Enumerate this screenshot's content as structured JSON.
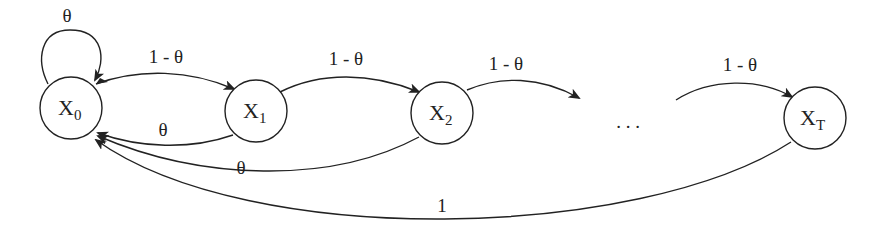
{
  "diagram": {
    "type": "markov-chain",
    "nodes": [
      {
        "id": "x0",
        "label": "X",
        "sub": "0"
      },
      {
        "id": "x1",
        "label": "X",
        "sub": "1"
      },
      {
        "id": "x2",
        "label": "X",
        "sub": "2"
      },
      {
        "id": "xt",
        "label": "X",
        "sub": "T"
      }
    ],
    "ellipsis": ". . .",
    "edges": [
      {
        "from": "x0",
        "to": "x0",
        "label": "θ"
      },
      {
        "from": "x0",
        "to": "x1",
        "label": "1 - θ"
      },
      {
        "from": "x1",
        "to": "x0",
        "label": "θ"
      },
      {
        "from": "x1",
        "to": "x2",
        "label": "1 - θ"
      },
      {
        "from": "x2",
        "to": "x0",
        "label": "θ"
      },
      {
        "from": "x2",
        "to": "ellipsis",
        "label": "1 - θ"
      },
      {
        "from": "ellipsis",
        "to": "xt",
        "label": "1 - θ"
      },
      {
        "from": "xt",
        "to": "x0",
        "label": "1"
      }
    ],
    "colors": {
      "stroke": "#222222",
      "background": "#ffffff"
    }
  }
}
